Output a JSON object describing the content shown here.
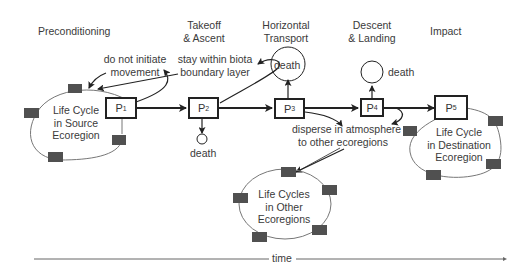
{
  "stages": [
    {
      "id": "preconditioning",
      "label": "Preconditioning"
    },
    {
      "id": "takeoff",
      "label_line1": "Takeoff",
      "label_line2": "& Ascent"
    },
    {
      "id": "horizontal",
      "label_line1": "Horizontal",
      "label_line2": "Transport"
    },
    {
      "id": "descent",
      "label_line1": "Descent",
      "label_line2": "& Landing"
    },
    {
      "id": "impact",
      "label": "Impact"
    }
  ],
  "phases": [
    {
      "id": "P1",
      "letter": "P",
      "sub": "1"
    },
    {
      "id": "P2",
      "letter": "P",
      "sub": "2"
    },
    {
      "id": "P3",
      "letter": "P",
      "sub": "3"
    },
    {
      "id": "P4",
      "letter": "P",
      "sub": "4"
    },
    {
      "id": "P5",
      "letter": "P",
      "sub": "5"
    }
  ],
  "annotations": {
    "no_initiate_line1": "do not initiate",
    "no_initiate_line2": "movement",
    "stay_within_line1": "stay within biota",
    "stay_within_line2": "boundary layer",
    "disperse_line1": "disperse in atmosphere",
    "disperse_line2": "to other ecoregions"
  },
  "deaths": {
    "p2": "death",
    "p3": "death",
    "p4": "death"
  },
  "cycles": {
    "source": [
      "Life Cycle",
      "in Source",
      "Ecoregion"
    ],
    "destination": [
      "Life Cycle",
      "in Destination",
      "Ecoregion"
    ],
    "other": [
      "Life Cycles",
      "in Other",
      "Ecoregions"
    ]
  },
  "time_axis": {
    "label": "time"
  },
  "colors": {
    "stroke": "#222222",
    "cycle_line": "#777777",
    "stage_square": "#505050"
  }
}
